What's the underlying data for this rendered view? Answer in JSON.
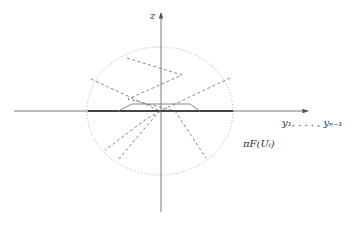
{
  "diagram": {
    "labels": {
      "z_axis": "z",
      "horizontal_axis": "y₁, . . . , yₙ₋₁",
      "region": "πF(Uᵢ)"
    },
    "colors": {
      "axis": "#555555",
      "thick_segment": "#444444",
      "ellipse": "#9a9a9a",
      "dashed": "#666666",
      "trapezoid": "#888888"
    }
  }
}
